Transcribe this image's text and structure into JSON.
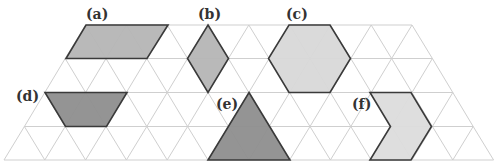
{
  "diagram": {
    "type": "triangular-grid-polygons",
    "grid": {
      "rows": 4,
      "side_px": 40.8,
      "row_ys": [
        25,
        58.5,
        92.5,
        126.5,
        160
      ],
      "line_color": "#cfcfcf"
    },
    "colors": {
      "stroke": "#3a3a3a",
      "light_fill": "#d9d9d9",
      "mid_fill": "#b3b3b3",
      "dark_fill": "#8a8a8a"
    },
    "shapes": [
      {
        "label": "(a)",
        "name": "parallelogram",
        "fill": "#b5b5b5",
        "points": "86,25 168,25 147,58.5 66,58.5",
        "label_xy": [
          86,
          19
        ]
      },
      {
        "label": "(b)",
        "name": "rhombus",
        "fill": "#b5b5b5",
        "points": "208,25 228.5,58.5 208,92.5 187.5,58.5",
        "label_xy": [
          198,
          19
        ]
      },
      {
        "label": "(c)",
        "name": "hexagon",
        "fill": "#d8d8d8",
        "points": "289,25 330,25 350.5,58.5 330,92.5 289,92.5 268.5,58.5",
        "label_xy": [
          286,
          19
        ]
      },
      {
        "label": "(d)",
        "name": "trapezoid",
        "fill": "#8e8e8e",
        "points": "45,92.5 127,92.5 106.5,126.5 65.5,126.5",
        "label_xy": [
          16,
          101
        ]
      },
      {
        "label": "(e)",
        "name": "triangle",
        "fill": "#8e8e8e",
        "points": "249,92.5 290,160 208,160",
        "label_xy": [
          216,
          109
        ]
      },
      {
        "label": "(f)",
        "name": "chevron",
        "fill": "#dcdcdc",
        "points": "370,92.5 411,92.5 431.5,126.5 411,160 370,160 390.5,126.5",
        "label_xy": [
          352,
          109
        ]
      }
    ]
  }
}
